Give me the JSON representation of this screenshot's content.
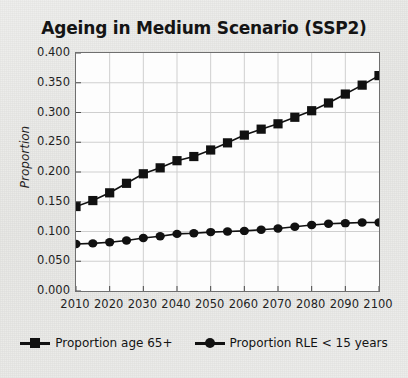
{
  "chart_data": {
    "type": "line",
    "title": "Ageing in Medium Scenario (SSP2)",
    "xlabel": "",
    "ylabel": "Proportion",
    "xlim": [
      2010,
      2100
    ],
    "ylim": [
      0.0,
      0.4
    ],
    "grid": true,
    "legend_position": "bottom",
    "x": [
      2010,
      2015,
      2020,
      2025,
      2030,
      2035,
      2040,
      2045,
      2050,
      2055,
      2060,
      2065,
      2070,
      2075,
      2080,
      2085,
      2090,
      2095,
      2100
    ],
    "xticks": [
      "2010",
      "2020",
      "2030",
      "2040",
      "2050",
      "2060",
      "2070",
      "2080",
      "2090",
      "2100"
    ],
    "yticks": [
      "0.000",
      "0.050",
      "0.100",
      "0.150",
      "0.200",
      "0.250",
      "0.300",
      "0.350",
      "0.400"
    ],
    "series": [
      {
        "name": "Proportion age 65+",
        "marker": "square",
        "color": "#111111",
        "values": [
          0.142,
          0.152,
          0.165,
          0.181,
          0.197,
          0.207,
          0.219,
          0.226,
          0.237,
          0.249,
          0.262,
          0.272,
          0.281,
          0.292,
          0.303,
          0.316,
          0.331,
          0.346,
          0.362
        ]
      },
      {
        "name": "Proportion RLE < 15 years",
        "marker": "circle",
        "color": "#111111",
        "values": [
          0.079,
          0.08,
          0.082,
          0.085,
          0.089,
          0.092,
          0.096,
          0.097,
          0.099,
          0.1,
          0.101,
          0.103,
          0.105,
          0.108,
          0.111,
          0.113,
          0.114,
          0.115,
          0.115
        ]
      }
    ]
  },
  "legend": {
    "entries": [
      {
        "label": "Proportion age 65+"
      },
      {
        "label": "Proportion RLE < 15 years"
      }
    ]
  }
}
